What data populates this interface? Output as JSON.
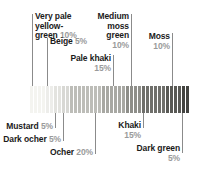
{
  "chart_data": {
    "type": "bar",
    "title": "",
    "subtitle": "",
    "xlabel": "",
    "ylabel": "",
    "legend_position": "callouts",
    "grid": false,
    "orientation": "horizontal-stacked-strip",
    "note": "Horizontal colour-proportion strip: each named colour occupies a share of the total bar width equal to its percentage.",
    "categories": [
      "Very pale yellow-green",
      "Beige",
      "Mustard",
      "Dark ocher",
      "Ocher",
      "Pale khaki",
      "Medium moss green",
      "Khaki",
      "Moss",
      "Dark green"
    ],
    "values": [
      10,
      5,
      5,
      5,
      20,
      15,
      10,
      15,
      10,
      5
    ],
    "unit": "%",
    "ylim": [
      0,
      100
    ],
    "swatch_colors": [
      "#f4f4f0",
      "#ededea",
      "#e3e3df",
      "#d8d8d4",
      "#bdbdb8",
      "#a8a8a3",
      "#8e8e89",
      "#6f6f6b",
      "#595955",
      "#434340"
    ]
  },
  "callouts": {
    "top": [
      {
        "id": "very-pale-yellow-green",
        "lines": [
          "Very pale",
          "yellow-",
          "green"
        ],
        "percent": "10%",
        "align": "left"
      },
      {
        "id": "beige",
        "lines": [
          "Beige"
        ],
        "percent": "5%",
        "align": "left"
      },
      {
        "id": "pale-khaki",
        "lines": [
          "Pale khaki"
        ],
        "percent": "15%",
        "align": "right"
      },
      {
        "id": "medium-moss-green",
        "lines": [
          "Medium",
          "moss",
          "green"
        ],
        "percent": "10%",
        "align": "right"
      },
      {
        "id": "moss",
        "lines": [
          "Moss"
        ],
        "percent": "10%",
        "align": "right"
      }
    ],
    "bottom": [
      {
        "id": "mustard",
        "lines": [
          "Mustard"
        ],
        "percent": "5%",
        "align": "right"
      },
      {
        "id": "dark-ocher",
        "lines": [
          "Dark ocher"
        ],
        "percent": "5%",
        "align": "right"
      },
      {
        "id": "ocher",
        "lines": [
          "Ocher"
        ],
        "percent": "20%",
        "align": "right"
      },
      {
        "id": "khaki",
        "lines": [
          "Khaki"
        ],
        "percent": "15%",
        "align": "right"
      },
      {
        "id": "dark-green",
        "lines": [
          "Dark green"
        ],
        "percent": "5%",
        "align": "right"
      }
    ]
  },
  "text": {
    "very_pale_yellow_green_l1": "Very pale",
    "very_pale_yellow_green_l2": "yellow-",
    "very_pale_yellow_green_l3": "green",
    "very_pale_yellow_green_pct": "10%",
    "beige": "Beige",
    "beige_pct": "5%",
    "pale_khaki": "Pale khaki",
    "pale_khaki_pct": "15%",
    "medium_moss_green_l1": "Medium",
    "medium_moss_green_l2": "moss",
    "medium_moss_green_l3": "green",
    "medium_moss_green_pct": "10%",
    "moss": "Moss",
    "moss_pct": "10%",
    "mustard": "Mustard",
    "mustard_pct": "5%",
    "dark_ocher": "Dark ocher",
    "dark_ocher_pct": "5%",
    "ocher": "Ocher",
    "ocher_pct": "20%",
    "khaki": "Khaki",
    "khaki_pct": "15%",
    "dark_green": "Dark green",
    "dark_green_pct": "5%"
  }
}
